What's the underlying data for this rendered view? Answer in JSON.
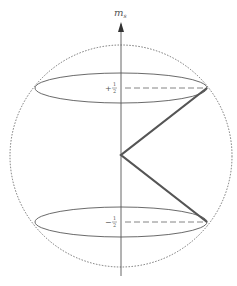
{
  "diagram": {
    "axis_label": "m",
    "axis_label_sub": "s",
    "levels": [
      {
        "sign": "+",
        "num": "1",
        "den": "2",
        "value": "+1/2"
      },
      {
        "sign": "−",
        "num": "1",
        "den": "2",
        "value": "−1/2"
      }
    ],
    "colors": {
      "line": "#444444",
      "vector": "#555555",
      "sphere": "#555555",
      "dashed": "#666666"
    }
  }
}
